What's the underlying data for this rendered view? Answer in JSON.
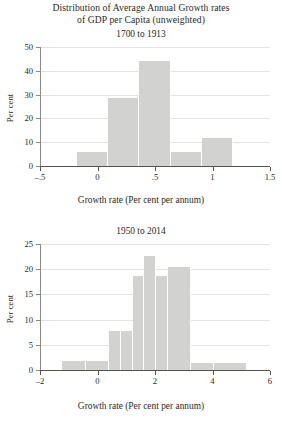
{
  "figure": {
    "title_line1": "Distribution of Average Annual Growth rates",
    "title_line2": "of GDP per Capita (unweighted)"
  },
  "chart_data": [
    {
      "type": "bar",
      "title": "1700 to 1913",
      "xlabel": "Growth rate (Per cent per annum)",
      "ylabel": "Per cent",
      "xlim": [
        -0.5,
        1.5
      ],
      "ylim": [
        0,
        50
      ],
      "grid": true,
      "legend": "none",
      "xticks": [
        -0.5,
        0,
        0.5,
        1,
        1.5
      ],
      "xtick_labels": [
        "–.5",
        "0",
        ".5",
        "1",
        "1.5"
      ],
      "yticks": [
        0,
        10,
        20,
        30,
        40,
        50
      ],
      "ytick_labels": [
        "0",
        "10",
        "20",
        "30",
        "40",
        "50"
      ],
      "bin_width": 0.27,
      "bins": [
        {
          "left": -0.175,
          "right": 0.095,
          "value": 5.8
        },
        {
          "left": 0.095,
          "right": 0.365,
          "value": 28.5
        },
        {
          "left": 0.365,
          "right": 0.635,
          "value": 44.3
        },
        {
          "left": 0.635,
          "right": 0.905,
          "value": 5.8
        },
        {
          "left": 0.905,
          "right": 1.175,
          "value": 11.9
        }
      ]
    },
    {
      "type": "bar",
      "title": "1950 to 2014",
      "xlabel": "Growth rate (Per cent per annum)",
      "ylabel": "Per cent",
      "xlim": [
        -2,
        6
      ],
      "ylim": [
        0,
        25
      ],
      "grid": true,
      "legend": "none",
      "xticks": [
        -2,
        0,
        2,
        4,
        6
      ],
      "xtick_labels": [
        "–2",
        "0",
        "2",
        "4",
        "6"
      ],
      "yticks": [
        0,
        5,
        10,
        15,
        20,
        25
      ],
      "ytick_labels": [
        "0",
        "5",
        "10",
        "15",
        "20",
        "25"
      ],
      "bin_width": 0.81,
      "bins": [
        {
          "left": -1.22,
          "right": -0.41,
          "value": 1.7
        },
        {
          "left": -0.41,
          "right": 0.4,
          "value": 1.7
        },
        {
          "left": 0.4,
          "right": 0.81,
          "value": 7.8
        },
        {
          "left": 0.81,
          "right": 1.22,
          "value": 7.8
        },
        {
          "left": 1.22,
          "right": 1.63,
          "value": 18.7
        },
        {
          "left": 1.63,
          "right": 2.03,
          "value": 22.7
        },
        {
          "left": 2.03,
          "right": 2.44,
          "value": 18.7
        },
        {
          "left": 2.44,
          "right": 3.25,
          "value": 20.5
        },
        {
          "left": 3.25,
          "right": 4.06,
          "value": 1.4
        },
        {
          "left": 4.06,
          "right": 5.2,
          "value": 1.4
        }
      ]
    }
  ]
}
